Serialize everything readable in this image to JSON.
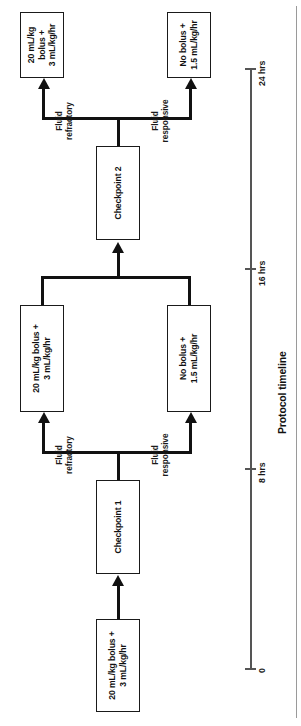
{
  "figure": {
    "type": "clinical-protocol-flowchart",
    "orientation": "rotated-90-counterclockwise",
    "nodes": {
      "start": {
        "label": "20 mL/kg bolus +\n3 mL/kg/hr"
      },
      "checkpoint1": {
        "label": "Checkpoint 1"
      },
      "cp1_refractory_out": {
        "label": "20 mL/kg bolus +\n3 mL/kg/hr"
      },
      "cp1_responsive_out": {
        "label": "No bolus +\n1.5 mL/kg/hr"
      },
      "checkpoint2": {
        "label": "Checkpoint 2"
      },
      "cp2_refractory_out": {
        "label": "20 mL/kg bolus +\n3 mL/kg/hr"
      },
      "cp2_responsive_out": {
        "label": "No bolus +\n1.5 mL/kg/hr"
      }
    },
    "edge_labels": {
      "cp1_refractory": "Fluid\nrefractory",
      "cp1_responsive": "Fluid\nresponsive",
      "cp2_refractory": "Fluid\nrefractory",
      "cp2_responsive": "Fluid\nresponsive"
    },
    "timeline": {
      "title": "Protocol timeline",
      "ticks": [
        {
          "label": "0",
          "value": 0
        },
        {
          "label": "8 hrs",
          "value": 8
        },
        {
          "label": "16 hrs",
          "value": 16
        },
        {
          "label": "24 hrs",
          "value": 24
        }
      ],
      "range": [
        0,
        24
      ],
      "unit": "hrs"
    },
    "colors": {
      "stroke": "#111111",
      "box_border": "#1a1a1a",
      "background": "#ffffff",
      "axis": "#555555",
      "divider": "#9a9a9a"
    }
  }
}
